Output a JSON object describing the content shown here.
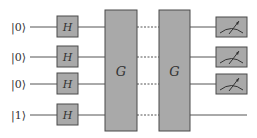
{
  "diagram": {
    "type": "quantum-circuit",
    "qubits": [
      {
        "label": "|0⟩",
        "y": 27,
        "measured": true
      },
      {
        "label": "|0⟩",
        "y": 57,
        "measured": true
      },
      {
        "label": "|0⟩",
        "y": 84,
        "measured": true
      },
      {
        "label": "|1⟩",
        "y": 115,
        "measured": false
      }
    ],
    "hadamard": {
      "label": "H"
    },
    "oracle_gates": [
      {
        "label": "G"
      },
      {
        "label": "G"
      }
    ],
    "colors": {
      "gate_fill": "#a9a9a9",
      "gate_stroke": "#4a4a4a",
      "wire": "#555555",
      "text": "#333333"
    }
  }
}
